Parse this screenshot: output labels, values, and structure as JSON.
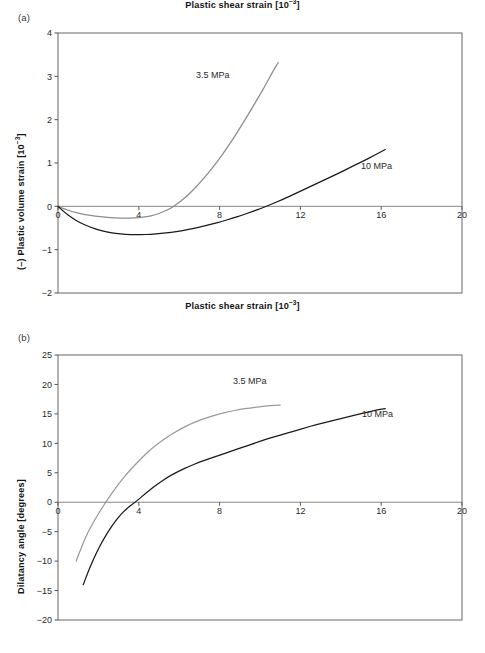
{
  "figure": {
    "panels": [
      {
        "id": "a",
        "label": "(a)",
        "series_labels": [
          {
            "text": "3.5 MPa",
            "x_px": 196,
            "y_px": 78
          },
          {
            "text": "10 MPa",
            "x_px": 361,
            "y_px": 169
          }
        ]
      },
      {
        "id": "b",
        "label": "(b)",
        "series_labels": [
          {
            "text": "3.5 MPa",
            "x_px": 233,
            "y_px": 384
          },
          {
            "text": "10 MPa",
            "x_px": 362,
            "y_px": 417
          }
        ]
      }
    ]
  },
  "chart_data": [
    {
      "type": "line",
      "panel": "a",
      "title": "",
      "xlabel": "Plastic shear strain [10-3]",
      "xlabel_base": "Plastic shear strain [10",
      "xlabel_exp": "−3",
      "xlabel_tail": "]",
      "ylabel": "(–) Plastic volume strain [10-3]",
      "ylabel_base": "(–) Plastic volume strain [10",
      "ylabel_exp": "−3",
      "ylabel_tail": "]",
      "xlim": [
        0,
        20
      ],
      "ylim": [
        -2,
        4
      ],
      "xticks": [
        0,
        4,
        8,
        12,
        16,
        20
      ],
      "yticks": [
        4,
        3,
        2,
        1,
        0,
        -1,
        -2
      ],
      "xtick_labels": [
        "0",
        "4",
        "8",
        "12",
        "16",
        "20"
      ],
      "ytick_labels": [
        "4",
        "3",
        "2",
        "1",
        "0",
        "−1",
        "−2"
      ],
      "grid": false,
      "legend_position": "inline-annotation",
      "zero_line": true,
      "series": [
        {
          "name": "3.5 MPa",
          "color": "#8c8c8c",
          "points": [
            [
              0.0,
              0.0
            ],
            [
              0.3,
              -0.06
            ],
            [
              0.7,
              -0.12
            ],
            [
              1.1,
              -0.17
            ],
            [
              1.6,
              -0.21
            ],
            [
              2.1,
              -0.24
            ],
            [
              2.6,
              -0.26
            ],
            [
              3.1,
              -0.27
            ],
            [
              3.6,
              -0.27
            ],
            [
              4.0,
              -0.26
            ],
            [
              4.4,
              -0.24
            ],
            [
              4.8,
              -0.2
            ],
            [
              5.2,
              -0.13
            ],
            [
              5.6,
              -0.04
            ],
            [
              5.9,
              0.06
            ],
            [
              6.3,
              0.2
            ],
            [
              6.7,
              0.38
            ],
            [
              7.1,
              0.58
            ],
            [
              7.5,
              0.8
            ],
            [
              7.9,
              1.04
            ],
            [
              8.3,
              1.3
            ],
            [
              8.7,
              1.58
            ],
            [
              9.1,
              1.88
            ],
            [
              9.5,
              2.18
            ],
            [
              9.9,
              2.5
            ],
            [
              10.3,
              2.82
            ],
            [
              10.6,
              3.08
            ],
            [
              10.9,
              3.32
            ]
          ]
        },
        {
          "name": "10 MPa",
          "color": "#1a1a1a",
          "points": [
            [
              0.0,
              0.0
            ],
            [
              0.3,
              -0.13
            ],
            [
              0.7,
              -0.27
            ],
            [
              1.1,
              -0.38
            ],
            [
              1.6,
              -0.48
            ],
            [
              2.1,
              -0.56
            ],
            [
              2.6,
              -0.61
            ],
            [
              3.1,
              -0.64
            ],
            [
              3.6,
              -0.655
            ],
            [
              4.1,
              -0.655
            ],
            [
              4.6,
              -0.645
            ],
            [
              5.1,
              -0.625
            ],
            [
              5.6,
              -0.6
            ],
            [
              6.1,
              -0.565
            ],
            [
              6.6,
              -0.52
            ],
            [
              7.1,
              -0.47
            ],
            [
              7.6,
              -0.41
            ],
            [
              8.1,
              -0.35
            ],
            [
              8.6,
              -0.28
            ],
            [
              9.1,
              -0.205
            ],
            [
              9.6,
              -0.125
            ],
            [
              10.1,
              -0.04
            ],
            [
              10.6,
              0.055
            ],
            [
              11.1,
              0.155
            ],
            [
              11.6,
              0.26
            ],
            [
              12.1,
              0.37
            ],
            [
              12.6,
              0.48
            ],
            [
              13.1,
              0.59
            ],
            [
              13.6,
              0.7
            ],
            [
              14.1,
              0.81
            ],
            [
              14.6,
              0.93
            ],
            [
              15.1,
              1.04
            ],
            [
              15.6,
              1.16
            ],
            [
              16.2,
              1.31
            ]
          ]
        }
      ]
    },
    {
      "type": "line",
      "panel": "b",
      "title": "",
      "xlabel": "Plastic shear strain [10-3]",
      "xlabel_base": "Plastic shear strain [10",
      "xlabel_exp": "−3",
      "xlabel_tail": "]",
      "ylabel": "Dilatancy angle [degrees]",
      "xlim": [
        0,
        20
      ],
      "ylim": [
        -20,
        25
      ],
      "xticks": [
        0,
        4,
        8,
        12,
        16,
        20
      ],
      "yticks": [
        25,
        20,
        15,
        10,
        5,
        0,
        -5,
        -10,
        -15,
        -20
      ],
      "xtick_labels": [
        "0",
        "4",
        "8",
        "12",
        "16",
        "20"
      ],
      "ytick_labels": [
        "25",
        "20",
        "15",
        "10",
        "5",
        "0",
        "−5",
        "−10",
        "−15",
        "−20"
      ],
      "grid": false,
      "legend_position": "inline-annotation",
      "zero_line": true,
      "series": [
        {
          "name": "3.5 MPa",
          "color": "#9a9a9a",
          "points": [
            [
              0.9,
              -10.0
            ],
            [
              1.1,
              -8.2
            ],
            [
              1.3,
              -6.5
            ],
            [
              1.5,
              -5.0
            ],
            [
              1.8,
              -3.1
            ],
            [
              2.1,
              -1.4
            ],
            [
              2.4,
              0.2
            ],
            [
              2.7,
              1.7
            ],
            [
              3.0,
              3.1
            ],
            [
              3.4,
              4.8
            ],
            [
              3.8,
              6.3
            ],
            [
              4.2,
              7.7
            ],
            [
              4.6,
              9.0
            ],
            [
              5.0,
              10.1
            ],
            [
              5.5,
              11.3
            ],
            [
              6.0,
              12.3
            ],
            [
              6.5,
              13.2
            ],
            [
              7.0,
              13.9
            ],
            [
              7.5,
              14.5
            ],
            [
              8.0,
              15.0
            ],
            [
              8.5,
              15.4
            ],
            [
              9.0,
              15.75
            ],
            [
              9.5,
              16.0
            ],
            [
              10.0,
              16.2
            ],
            [
              10.5,
              16.4
            ],
            [
              11.0,
              16.5
            ]
          ]
        },
        {
          "name": "10 MPa",
          "color": "#1a1a1a",
          "points": [
            [
              1.25,
              -14.0
            ],
            [
              1.45,
              -12.2
            ],
            [
              1.65,
              -10.5
            ],
            [
              1.9,
              -8.6
            ],
            [
              2.2,
              -6.6
            ],
            [
              2.5,
              -4.9
            ],
            [
              2.8,
              -3.4
            ],
            [
              3.1,
              -2.1
            ],
            [
              3.4,
              -1.1
            ],
            [
              3.7,
              -0.3
            ],
            [
              4.0,
              0.5
            ],
            [
              4.3,
              1.4
            ],
            [
              4.7,
              2.5
            ],
            [
              5.1,
              3.5
            ],
            [
              5.5,
              4.4
            ],
            [
              6.0,
              5.3
            ],
            [
              6.5,
              6.1
            ],
            [
              7.0,
              6.8
            ],
            [
              7.5,
              7.4
            ],
            [
              8.0,
              8.0
            ],
            [
              8.6,
              8.7
            ],
            [
              9.2,
              9.4
            ],
            [
              9.8,
              10.1
            ],
            [
              10.4,
              10.8
            ],
            [
              11.0,
              11.4
            ],
            [
              11.6,
              12.0
            ],
            [
              12.2,
              12.6
            ],
            [
              12.8,
              13.2
            ],
            [
              13.4,
              13.7
            ],
            [
              14.0,
              14.2
            ],
            [
              14.6,
              14.7
            ],
            [
              15.2,
              15.2
            ],
            [
              15.7,
              15.6
            ],
            [
              16.2,
              15.9
            ]
          ]
        }
      ]
    }
  ],
  "colors": {
    "axis": "#555555",
    "frame": "#666666",
    "zero_line": "#777777",
    "series_gray": "#8c8c8c",
    "series_black": "#1a1a1a",
    "text": "#1a1a1a"
  }
}
